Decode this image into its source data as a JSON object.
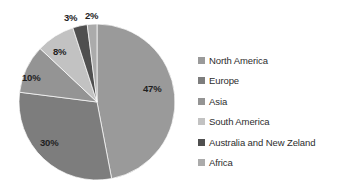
{
  "background": "#ffffff",
  "chart_data": {
    "type": "pie",
    "title": "",
    "subtitle": "",
    "xlabel": "",
    "ylabel": "",
    "grid": false,
    "legend_position": "right",
    "start_angle_deg": 0,
    "direction": "clockwise",
    "units": "%",
    "categories": [
      "North America",
      "Europe",
      "Asia",
      "South America",
      "Australia and New Zeland",
      "Africa"
    ],
    "values": [
      47,
      30,
      10,
      8,
      3,
      2
    ],
    "data_labels": [
      "47%",
      "30%",
      "10%",
      "8%",
      "3%",
      "2%"
    ],
    "colors": [
      "#9a9a9a",
      "#7d7d7d",
      "#949494",
      "#c2c2c2",
      "#4f4f4f",
      "#ababab"
    ],
    "slices": [
      {
        "label": "North America",
        "value": 47,
        "data_label": "47%",
        "color": "#9a9a9a",
        "label_position": "inside"
      },
      {
        "label": "Europe",
        "value": 30,
        "data_label": "30%",
        "color": "#7d7d7d",
        "label_position": "inside"
      },
      {
        "label": "Asia",
        "value": 10,
        "data_label": "10%",
        "color": "#949494",
        "label_position": "inside"
      },
      {
        "label": "South America",
        "value": 8,
        "data_label": "8%",
        "color": "#c2c2c2",
        "label_position": "inside"
      },
      {
        "label": "Australia and New Zeland",
        "value": 3,
        "data_label": "3%",
        "color": "#4f4f4f",
        "label_position": "outside"
      },
      {
        "label": "Africa",
        "value": 2,
        "data_label": "2%",
        "color": "#ababab",
        "label_position": "outside"
      }
    ],
    "geometry": {
      "center_x": 97,
      "center_y": 102,
      "radius": 78
    }
  },
  "legend": {
    "items": [
      {
        "label": "North America",
        "color": "#9a9a9a"
      },
      {
        "label": "Europe",
        "color": "#7d7d7d"
      },
      {
        "label": "Asia",
        "color": "#949494"
      },
      {
        "label": "South America",
        "color": "#c2c2c2"
      },
      {
        "label": "Australia and New Zeland",
        "color": "#4f4f4f"
      },
      {
        "label": "Africa",
        "color": "#ababab"
      }
    ]
  },
  "labels": {
    "pct_north_america": "47%",
    "pct_europe": "30%",
    "pct_asia": "10%",
    "pct_south_america": "8%",
    "pct_australia": "3%",
    "pct_africa": "2%"
  }
}
